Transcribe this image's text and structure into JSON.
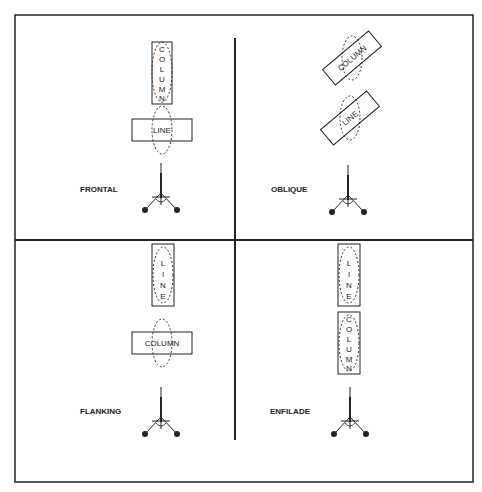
{
  "quadrants": [
    {
      "label": "FRONTAL",
      "top_target": "COLUMN",
      "bottom_target": "LINE"
    },
    {
      "label": "OBLIQUE",
      "top_target": "COLUMN",
      "bottom_target": "LINE"
    },
    {
      "label": "FLANKING",
      "top_target": "LINE",
      "bottom_target": "COLUMN"
    },
    {
      "label": "ENFILADE",
      "top_target": "LINE",
      "bottom_target": "COLUMN"
    }
  ],
  "icons": {
    "weapon": "tripod-machine-gun-icon",
    "beaten_zone": "dashed-ellipse"
  }
}
